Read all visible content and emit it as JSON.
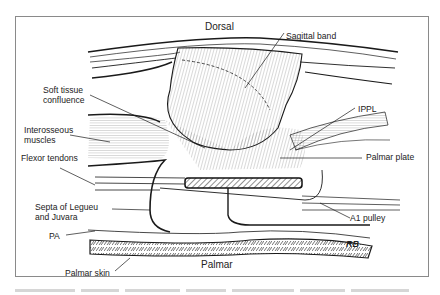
{
  "figure": {
    "orientation_top": "Dorsal",
    "orientation_bottom": "Palmar",
    "artist_initials": "RB",
    "labels": {
      "sagittal_band": "Sagittal band",
      "soft_tissue_confluence": "Soft tissue\nconfluence",
      "ippl": "IPPL",
      "interosseous_muscles": "Interosseous\nmuscles",
      "palmar_plate": "Palmar plate",
      "flexor_tendons": "Flexor tendons",
      "septa": "Septa of Legueu\nand Juvara",
      "a1_pulley": "A1 pulley",
      "pa": "PA",
      "palmar_skin": "Palmar skin"
    }
  },
  "colors": {
    "line": "#1a1a1a",
    "frame": "#8a8a8a",
    "hatch": "#444444"
  }
}
